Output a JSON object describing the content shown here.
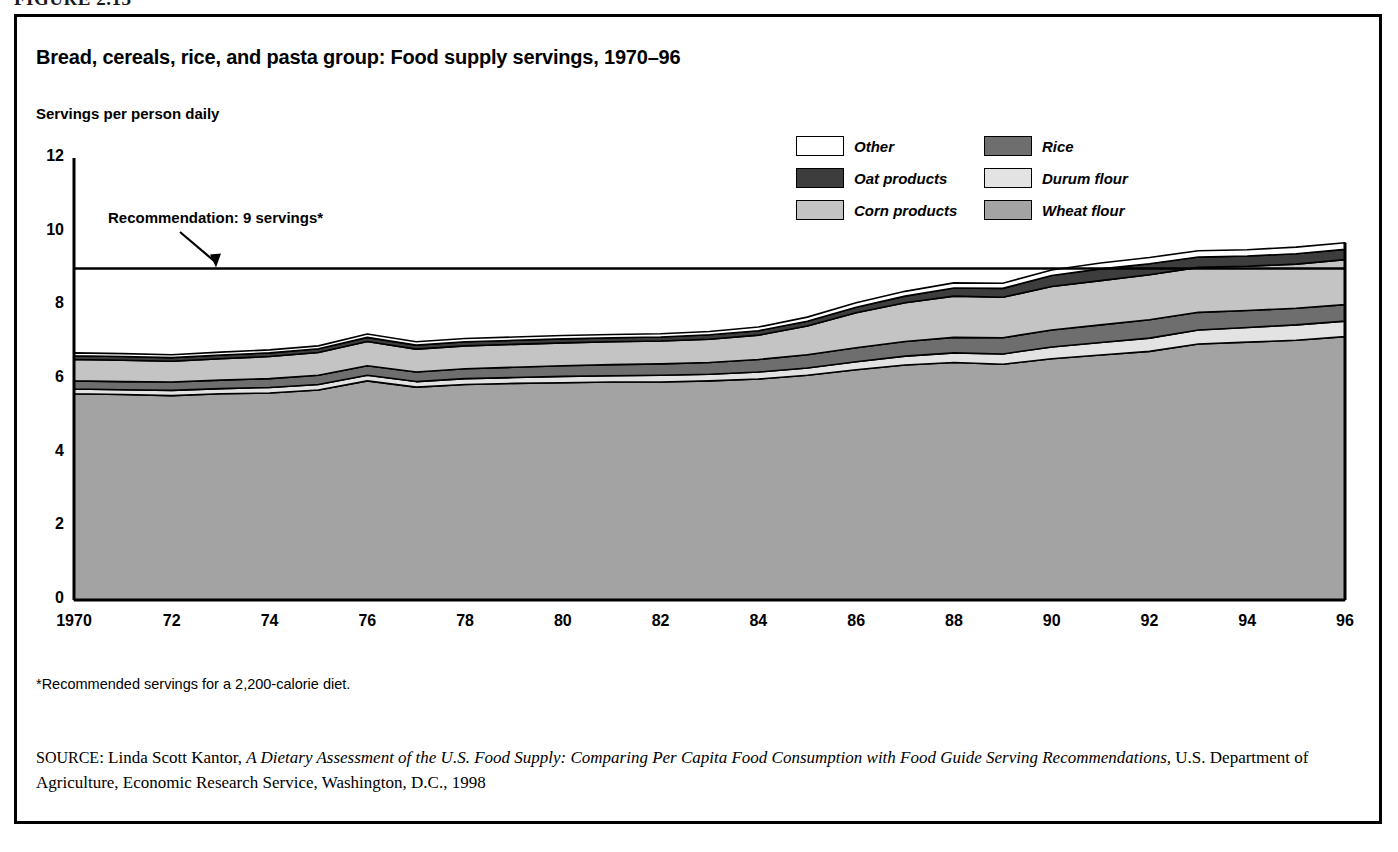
{
  "figure_label": "FIGURE 2.13",
  "chart": {
    "title": "Bread, cereals, rice, and pasta group: Food supply servings, 1970–96",
    "y_axis_title": "Servings per person daily",
    "annotation": "Recommendation: 9 servings*",
    "footnote": "*Recommended servings for a 2,200-calorie diet.",
    "source": {
      "prefix": "SOURCE",
      "sep": ": ",
      "author": "Linda Scott Kantor, ",
      "work": "A Dietary Assessment of the U.S. Food Supply: Comparing Per Capita Food Consumption with Food Guide Serving Recommendations,",
      "publisher": " U.S. Department of Agriculture, Economic Research Service, Washington, D.C., 1998"
    }
  },
  "legend": {
    "column_1": [
      {
        "label": "Other",
        "color": "#ffffff"
      },
      {
        "label": "Oat products",
        "color": "#3d3d3d"
      },
      {
        "label": "Corn products",
        "color": "#c4c4c4"
      }
    ],
    "column_2": [
      {
        "label": "Rice",
        "color": "#6e6e6e"
      },
      {
        "label": "Durum flour",
        "color": "#e3e3e3"
      },
      {
        "label": "Wheat flour",
        "color": "#a3a3a3"
      }
    ]
  },
  "chart_data": {
    "type": "area",
    "stacked": true,
    "title": "Bread, cereals, rice, and pasta group: Food supply servings, 1970–96",
    "xlabel": "",
    "ylabel": "Servings per person daily",
    "xlim": [
      1970,
      1996
    ],
    "ylim": [
      0,
      12
    ],
    "yticks": [
      0,
      2,
      4,
      6,
      8,
      10,
      12
    ],
    "xticks": [
      1970,
      1972,
      1974,
      1976,
      1978,
      1980,
      1982,
      1984,
      1986,
      1988,
      1990,
      1992,
      1994,
      1996
    ],
    "xticklabels": [
      "1970",
      "72",
      "74",
      "76",
      "78",
      "80",
      "82",
      "84",
      "86",
      "88",
      "90",
      "92",
      "94",
      "96"
    ],
    "grid": false,
    "legend_position": "top-right",
    "reference_line": {
      "label": "Recommendation: 9 servings*",
      "value": 9
    },
    "x": [
      1970,
      1971,
      1972,
      1973,
      1974,
      1975,
      1976,
      1977,
      1978,
      1979,
      1980,
      1981,
      1982,
      1983,
      1984,
      1985,
      1986,
      1987,
      1988,
      1989,
      1990,
      1991,
      1992,
      1993,
      1994,
      1995,
      1996
    ],
    "series": [
      {
        "name": "Wheat flour",
        "color": "#a3a3a3",
        "values": [
          5.6,
          5.58,
          5.55,
          5.6,
          5.62,
          5.7,
          5.95,
          5.78,
          5.85,
          5.88,
          5.9,
          5.92,
          5.92,
          5.95,
          6.0,
          6.1,
          6.25,
          6.38,
          6.45,
          6.4,
          6.55,
          6.65,
          6.75,
          6.95,
          7.0,
          7.05,
          7.15
        ]
      },
      {
        "name": "Durum flour",
        "color": "#e3e3e3",
        "values": [
          0.13,
          0.13,
          0.14,
          0.14,
          0.15,
          0.15,
          0.15,
          0.15,
          0.16,
          0.16,
          0.17,
          0.17,
          0.18,
          0.18,
          0.19,
          0.2,
          0.22,
          0.24,
          0.26,
          0.28,
          0.32,
          0.34,
          0.36,
          0.38,
          0.4,
          0.42,
          0.42
        ]
      },
      {
        "name": "Rice",
        "color": "#6e6e6e",
        "values": [
          0.22,
          0.22,
          0.23,
          0.23,
          0.24,
          0.25,
          0.26,
          0.26,
          0.27,
          0.28,
          0.29,
          0.3,
          0.31,
          0.32,
          0.34,
          0.36,
          0.38,
          0.4,
          0.42,
          0.44,
          0.46,
          0.48,
          0.5,
          0.48,
          0.46,
          0.45,
          0.45
        ]
      },
      {
        "name": "Corn products",
        "color": "#c4c4c4",
        "values": [
          0.58,
          0.58,
          0.56,
          0.58,
          0.6,
          0.62,
          0.66,
          0.62,
          0.62,
          0.62,
          0.62,
          0.62,
          0.62,
          0.63,
          0.66,
          0.78,
          0.95,
          1.05,
          1.12,
          1.1,
          1.18,
          1.2,
          1.22,
          1.22,
          1.2,
          1.2,
          1.22
        ]
      },
      {
        "name": "Oat products",
        "color": "#3d3d3d",
        "values": [
          0.1,
          0.1,
          0.1,
          0.1,
          0.1,
          0.1,
          0.11,
          0.11,
          0.11,
          0.11,
          0.11,
          0.11,
          0.11,
          0.12,
          0.12,
          0.13,
          0.15,
          0.18,
          0.22,
          0.24,
          0.3,
          0.32,
          0.3,
          0.28,
          0.28,
          0.28,
          0.28
        ]
      },
      {
        "name": "Other",
        "color": "#ffffff",
        "values": [
          0.08,
          0.08,
          0.08,
          0.08,
          0.08,
          0.08,
          0.09,
          0.09,
          0.09,
          0.09,
          0.09,
          0.09,
          0.09,
          0.09,
          0.1,
          0.11,
          0.12,
          0.13,
          0.14,
          0.14,
          0.15,
          0.16,
          0.17,
          0.17,
          0.17,
          0.18,
          0.18
        ]
      }
    ],
    "totals": [
      6.71,
      6.69,
      6.66,
      6.73,
      6.79,
      6.9,
      7.22,
      7.01,
      7.1,
      7.14,
      7.18,
      7.21,
      7.23,
      7.29,
      7.41,
      7.68,
      8.07,
      8.38,
      8.61,
      8.6,
      8.96,
      9.15,
      9.3,
      9.48,
      9.51,
      9.58,
      9.7
    ]
  }
}
